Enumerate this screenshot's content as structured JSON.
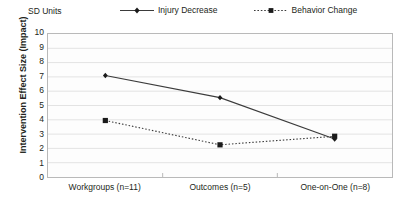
{
  "unit_label": "SD Units",
  "y_axis_title": "Intervention Effect Size (Impact)",
  "legend": {
    "items": [
      {
        "label": "Injury Decrease",
        "key_icon": "solid-line-diamond-marker"
      },
      {
        "label": "Behavior Change",
        "key_icon": "dotted-line-square-marker"
      }
    ]
  },
  "colors": {
    "line": "#3b3b3b",
    "marker": "#1a1a1a",
    "gridline": "#e3e3e3",
    "axis": "#b9b9b9",
    "text": "#231f20",
    "plot_background": "#fdfdfd"
  },
  "chart_data": {
    "type": "line",
    "title": "",
    "subtitle": "",
    "xlabel": "",
    "ylabel": "Intervention Effect Size (Impact)",
    "unit_label": "SD Units",
    "categories": [
      "Workgroups (n=11)",
      "Outcomes (n=5)",
      "One-on-One (n=8)"
    ],
    "ylim": [
      0,
      10
    ],
    "yticks": [
      10,
      9,
      8,
      7,
      6,
      5,
      4,
      3,
      2,
      1,
      0
    ],
    "grid": true,
    "legend_position": "top",
    "series": [
      {
        "name": "Injury Decrease",
        "values": [
          7.1,
          5.55,
          2.65
        ],
        "line_style": "solid",
        "marker": "diamond"
      },
      {
        "name": "Behavior Change",
        "values": [
          3.95,
          2.25,
          2.85
        ],
        "line_style": "dotted",
        "marker": "square"
      }
    ]
  }
}
